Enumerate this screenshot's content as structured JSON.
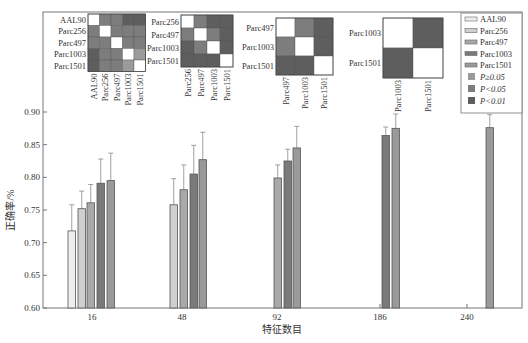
{
  "chart_data": {
    "type": "bar",
    "title": "",
    "xlabel": "特征数目",
    "ylabel": "正确率/%",
    "ylim": [
      0.6,
      0.9
    ],
    "yticks": [
      "0.60",
      "0.65",
      "0.70",
      "0.75",
      "0.80",
      "0.85",
      "0.90"
    ],
    "categories": [
      "16",
      "48",
      "92",
      "186",
      "240"
    ],
    "series": [
      {
        "name": "AAL90",
        "color": "#eeeeee",
        "values": [
          0.718,
          null,
          null,
          null,
          null
        ],
        "errors": [
          0.04,
          null,
          null,
          null,
          null
        ]
      },
      {
        "name": "Parc256",
        "color": "#cfcfcf",
        "values": [
          0.752,
          0.758,
          null,
          null,
          null
        ],
        "errors": [
          0.027,
          0.04,
          null,
          null,
          null
        ]
      },
      {
        "name": "Parc497",
        "color": "#a9a9a9",
        "values": [
          0.761,
          0.781,
          0.799,
          null,
          null
        ],
        "errors": [
          0.028,
          0.038,
          0.02,
          null,
          null
        ]
      },
      {
        "name": "Parc1003",
        "color": "#7a7a7a",
        "values": [
          0.791,
          0.805,
          0.825,
          0.864,
          null
        ],
        "errors": [
          0.037,
          0.044,
          0.018,
          0.013,
          null
        ]
      },
      {
        "name": "Parc1501",
        "color": "#9a9a9a",
        "values": [
          0.795,
          0.827,
          0.845,
          0.875,
          0.876
        ],
        "errors": [
          0.042,
          0.042,
          0.033,
          0.022,
          0.02
        ]
      }
    ],
    "grid": false,
    "legend_position": "top-right",
    "legend": {
      "series": [
        "AAL90",
        "Parc256",
        "Parc497",
        "Parc1003",
        "Parc1501"
      ],
      "significance": [
        {
          "label": "P≥0.05",
          "color": "#9b9b9b"
        },
        {
          "label": "P<0.05",
          "color": "#7d7d7d"
        },
        {
          "label": "P<0.01",
          "color": "#5e5e5e"
        }
      ]
    },
    "significance_matrices": [
      {
        "labels": [
          "AAL90",
          "Parc256",
          "Parc497",
          "Parc1003",
          "Parc1501"
        ],
        "cells": [
          [
            0,
            2,
            2,
            3,
            3
          ],
          [
            2,
            0,
            2,
            2,
            2
          ],
          [
            2,
            2,
            0,
            2,
            2
          ],
          [
            3,
            2,
            2,
            0,
            1
          ],
          [
            3,
            2,
            2,
            1,
            0
          ]
        ]
      },
      {
        "labels": [
          "Parc256",
          "Parc497",
          "Parc1003",
          "Parc1501"
        ],
        "cells": [
          [
            0,
            2,
            3,
            3
          ],
          [
            2,
            0,
            2,
            3
          ],
          [
            3,
            2,
            0,
            3
          ],
          [
            3,
            3,
            3,
            0
          ]
        ]
      },
      {
        "labels": [
          "Parc497",
          "Parc1003",
          "Parc1501"
        ],
        "cells": [
          [
            0,
            2,
            3
          ],
          [
            2,
            0,
            3
          ],
          [
            3,
            3,
            0
          ]
        ]
      },
      {
        "labels": [
          "Parc1003",
          "Parc1501"
        ],
        "cells": [
          [
            0,
            3
          ],
          [
            3,
            0
          ]
        ]
      }
    ]
  }
}
